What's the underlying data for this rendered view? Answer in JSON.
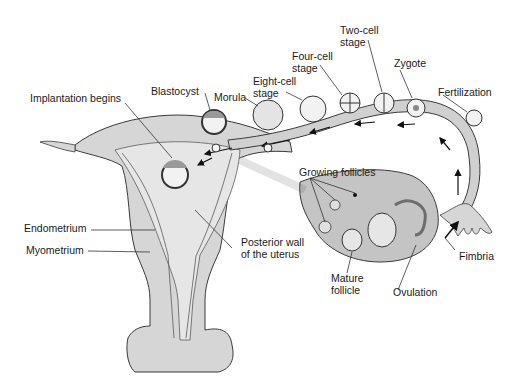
{
  "diagram": {
    "colors": {
      "background": "#ffffff",
      "tissue_fill": "#d6d6d6",
      "tissue_light": "#e6e6e6",
      "ovary_fill": "#c4c4c4",
      "outline": "#3a3a3a",
      "text": "#1a1a1a"
    },
    "labels": {
      "implantation": "Implantation begins",
      "blastocyst": "Blastocyst",
      "morula": "Morula",
      "eight_cell": "Eight-cell\nstage",
      "four_cell": "Four-cell\nstage",
      "two_cell": "Two-cell\nstage",
      "zygote": "Zygote",
      "fertilization": "Fertilization",
      "growing_follicles": "Growing follicles",
      "endometrium": "Endometrium",
      "myometrium": "Myometrium",
      "posterior_wall": "Posterior wall\nof the uterus",
      "fimbria": "Fimbria",
      "mature_follicle": "Mature\nfollicle",
      "ovulation": "Ovulation"
    }
  }
}
